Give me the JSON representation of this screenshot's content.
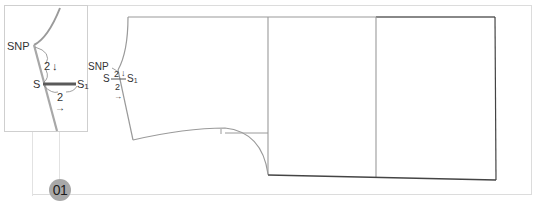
{
  "figure": {
    "step_badge": "01",
    "inset": {
      "point_snp": "SNP",
      "point_s": "S",
      "point_s1": "S1",
      "s1_main": "S",
      "s1_sub": "1",
      "down_measure": "2",
      "down_arrow": "↓",
      "across_measure": "2",
      "across_arrow": "→"
    },
    "pattern": {
      "point_snp": "SNP",
      "point_s": "S",
      "s1_main": "S",
      "s1_sub": "1",
      "down_measure": "2",
      "down_arrow": "↓",
      "across_measure": "2",
      "across_arrow": "→"
    },
    "colors": {
      "pattern_line": "#9a9a9a",
      "shoulder_extension": "#555555",
      "frame": "#dcdcdc",
      "badge": "#a8a8a8"
    }
  }
}
